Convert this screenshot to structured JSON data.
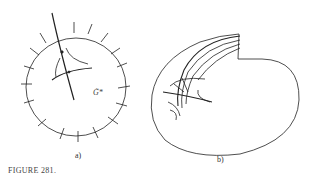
{
  "figure": {
    "caption": "FIGURE 281.",
    "panels": [
      {
        "id": "a",
        "label": "a)",
        "annotation": "G̃*"
      },
      {
        "id": "b",
        "label": "b)"
      }
    ]
  },
  "colors": {
    "ink": "#222222",
    "background": "#ffffff"
  }
}
